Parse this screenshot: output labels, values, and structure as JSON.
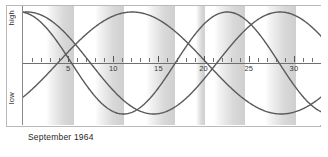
{
  "chart_data": {
    "type": "line",
    "title": "September 1964",
    "xlabel": "",
    "ylabel": "",
    "ylim": [
      -1,
      1
    ],
    "xlim": [
      0,
      33
    ],
    "grid": false,
    "legend": "none",
    "axis_labels": {
      "top": "high",
      "bottom": "low"
    },
    "x_ticks_major": [
      5,
      10,
      15,
      20,
      25,
      30
    ],
    "x_tick_labels": [
      "5",
      "10",
      "15",
      "20",
      "25",
      "30"
    ],
    "x_ticks_minor_step": 1,
    "today_marker_day": 20.5,
    "series": [
      {
        "name": "physical",
        "period_days": 23,
        "phase_deg": 96,
        "color": "#5a5a5a"
      },
      {
        "name": "emotional",
        "period_days": 28,
        "phase_deg": 84,
        "color": "#5a5a5a"
      },
      {
        "name": "intellectual",
        "period_days": 33,
        "phase_deg": 318,
        "color": "#5a5a5a"
      }
    ],
    "shaded_bands": [
      {
        "start": 2.6,
        "end": 5.6
      },
      {
        "start": 8.0,
        "end": 11.2
      },
      {
        "start": 13.6,
        "end": 16.8
      },
      {
        "start": 19.2,
        "end": 20.2
      },
      {
        "start": 21.2,
        "end": 24.6
      },
      {
        "start": 26.8,
        "end": 30.2
      }
    ],
    "band_gradient_from": "#ffffff",
    "band_gradient_to": "#cfcfcf",
    "curve_color": "#5a5a5a",
    "axis_color": "#6f6f6f",
    "frame_color": "#b9b9b9"
  },
  "footer": {
    "caption": "September 1964"
  }
}
